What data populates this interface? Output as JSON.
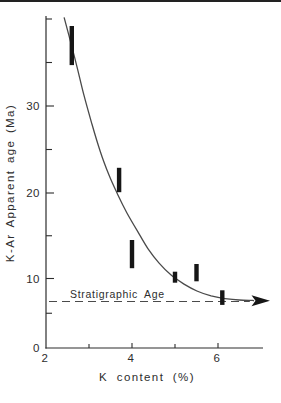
{
  "colors": {
    "background": "#ffffff",
    "ink": "#2d2d2d",
    "line": "#4a4a4a",
    "bar": "#161616",
    "scan_border": "#222222"
  },
  "chart_data": {
    "type": "scatter",
    "title": "",
    "xlabel": "K content (%)",
    "ylabel": "K-Ar Apparent age (Ma)",
    "xlim": [
      2,
      7.05
    ],
    "ylim": [
      0,
      40
    ],
    "grid": false,
    "legend": "none",
    "x_ticks": [
      {
        "value": 2,
        "label": "2"
      },
      {
        "value": 4,
        "label": "4"
      },
      {
        "value": 6,
        "label": "6"
      }
    ],
    "x_minor_ticks": [
      3,
      5
    ],
    "y_ticks": [
      {
        "value": 0,
        "label": "0"
      },
      {
        "value": 10,
        "label": "10"
      },
      {
        "value": 20,
        "label": "20"
      },
      {
        "value": 30,
        "label": "30"
      }
    ],
    "y_minor_ticks": [
      5,
      15,
      25,
      35,
      40
    ],
    "series": [
      {
        "name": "K-Ar apparent ages (vertical error bars)",
        "type": "error-bar",
        "points": [
          {
            "k": 2.6,
            "age_min": 34.7,
            "age_max": 39.2
          },
          {
            "k": 3.7,
            "age_min": 20.1,
            "age_max": 22.9
          },
          {
            "k": 4.0,
            "age_min": 11.2,
            "age_max": 14.5
          },
          {
            "k": 5.0,
            "age_min": 9.4,
            "age_max": 10.8
          },
          {
            "k": 5.5,
            "age_min": 9.6,
            "age_max": 11.7
          },
          {
            "k": 6.1,
            "age_min": 6.2,
            "age_max": 8.3
          }
        ]
      },
      {
        "name": "apparent age trend curve",
        "type": "line",
        "arrow_end": true,
        "points": [
          [
            2.42,
            40.2
          ],
          [
            2.56,
            37.6
          ],
          [
            2.72,
            34.5
          ],
          [
            2.88,
            31.3
          ],
          [
            3.07,
            27.9
          ],
          [
            3.26,
            24.8
          ],
          [
            3.47,
            22.0
          ],
          [
            3.67,
            19.8
          ],
          [
            3.88,
            17.7
          ],
          [
            4.12,
            15.6
          ],
          [
            4.37,
            13.5
          ],
          [
            4.63,
            11.8
          ],
          [
            4.91,
            10.4
          ],
          [
            5.21,
            9.2
          ],
          [
            5.51,
            8.2
          ],
          [
            5.84,
            7.5
          ],
          [
            6.16,
            7.1
          ],
          [
            6.49,
            6.9
          ],
          [
            6.81,
            6.85
          ]
        ]
      }
    ],
    "reference_line": {
      "label": "Stratigraphic Age",
      "age": 6.7,
      "style": "dashed",
      "k_start": 2.07,
      "k_end": 6.74
    }
  }
}
